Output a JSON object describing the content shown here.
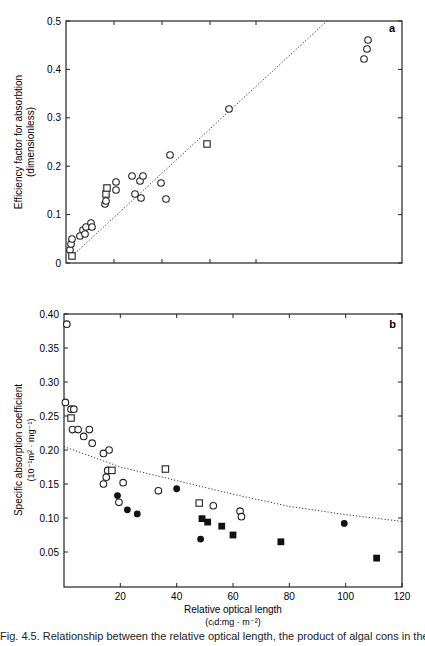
{
  "chart_data": [
    {
      "panel": "a",
      "type": "scatter",
      "title": "",
      "xlabel": "",
      "ylabel": "Efficiency factor for absorbtion (dimensionless)",
      "ylim": [
        0,
        0.5
      ],
      "yticks": [
        "0",
        "0.1",
        "0.2",
        "0.3",
        "0.4",
        "0.5"
      ],
      "x_tick_positions_px": [
        114,
        162,
        210,
        256
      ],
      "grid": false,
      "series": [
        {
          "name": "open circles",
          "marker": "open-circle",
          "points_px": [
            [
              70,
              250
            ],
            [
              71,
              244
            ],
            [
              72,
              239
            ],
            [
              80,
              236
            ],
            [
              83,
              230
            ],
            [
              85,
              234
            ],
            [
              86,
              227
            ],
            [
              91,
              223
            ],
            [
              92,
              227
            ],
            [
              105,
              204
            ],
            [
              106,
              201
            ],
            [
              116,
              190
            ],
            [
              116,
              182
            ],
            [
              132,
              176
            ],
            [
              135,
              194
            ],
            [
              140,
              181
            ],
            [
              141,
              198
            ],
            [
              143,
              176
            ],
            [
              161,
              183
            ],
            [
              166,
              199
            ],
            [
              170,
              155
            ],
            [
              229,
              109
            ],
            [
              364,
              59
            ],
            [
              367,
              49
            ],
            [
              368,
              40
            ]
          ]
        },
        {
          "name": "open squares",
          "marker": "open-square",
          "points_px": [
            [
              72,
              256
            ],
            [
              106,
              194
            ],
            [
              107,
              188
            ],
            [
              207,
              144
            ]
          ]
        }
      ],
      "trend": {
        "style": "dotted",
        "from_px": [
          70,
          258
        ],
        "to_px": [
          328,
          20
        ]
      }
    },
    {
      "panel": "b",
      "type": "scatter",
      "title": "",
      "xlabel": "Relative optical length (c_i d: mg · m^-2)",
      "ylabel": "Specific absorption coefficient (10^-1 m^2 · mg^-1)",
      "xlim": [
        0,
        120
      ],
      "ylim": [
        0,
        0.4
      ],
      "xticks": [
        "20",
        "40",
        "60",
        "80",
        "100",
        "120"
      ],
      "yticks": [
        "0.05",
        "0.10",
        "0.15",
        "0.20",
        "0.25",
        "0.30",
        "0.35",
        "0.40"
      ],
      "grid": false,
      "series": [
        {
          "name": "open circles",
          "marker": "open-circle",
          "values": [
            [
              1,
              0.385
            ],
            [
              0.5,
              0.27
            ],
            [
              2.5,
              0.26
            ],
            [
              3.5,
              0.26
            ],
            [
              3,
              0.23
            ],
            [
              5,
              0.23
            ],
            [
              7,
              0.22
            ],
            [
              9,
              0.23
            ],
            [
              10,
              0.21
            ],
            [
              16,
              0.2
            ],
            [
              14,
              0.195
            ],
            [
              15,
              0.16
            ],
            [
              15.5,
              0.17
            ],
            [
              14,
              0.15
            ],
            [
              21,
              0.152
            ],
            [
              19.5,
              0.123
            ],
            [
              33.5,
              0.14
            ],
            [
              53,
              0.118
            ],
            [
              62.5,
              0.11
            ],
            [
              63,
              0.102
            ]
          ]
        },
        {
          "name": "open squares",
          "marker": "open-square",
          "values": [
            [
              2.5,
              0.247
            ],
            [
              17,
              0.17
            ],
            [
              36,
              0.172
            ],
            [
              48,
              0.122
            ]
          ]
        },
        {
          "name": "filled circles",
          "marker": "filled-circle",
          "values": [
            [
              19,
              0.133
            ],
            [
              22.5,
              0.112
            ],
            [
              26,
              0.106
            ],
            [
              40,
              0.143
            ],
            [
              48.5,
              0.069
            ],
            [
              99.5,
              0.092
            ]
          ]
        },
        {
          "name": "filled squares",
          "marker": "filled-square",
          "values": [
            [
              49,
              0.099
            ],
            [
              51,
              0.094
            ],
            [
              56,
              0.088
            ],
            [
              60,
              0.075
            ],
            [
              77,
              0.065
            ],
            [
              111,
              0.041
            ]
          ]
        }
      ],
      "trend": {
        "style": "dotted",
        "points": [
          [
            0,
            0.205
          ],
          [
            20,
            0.175
          ],
          [
            40,
            0.155
          ],
          [
            60,
            0.135
          ],
          [
            80,
            0.117
          ],
          [
            100,
            0.105
          ],
          [
            120,
            0.095
          ]
        ]
      }
    }
  ],
  "panels": {
    "a": {
      "label": "a",
      "ylabel_line1": "Efficiency factor for absorbtion",
      "ylabel_line2": "(dimensionless)",
      "yticks": [
        "0.5",
        "0.4",
        "0.3",
        "0.2",
        "0.1",
        "0"
      ]
    },
    "b": {
      "label": "b",
      "ylabel_line1": "Specific absorption coefficient",
      "ylabel_line2": "(10⁻¹m² · mg⁻¹)",
      "yticks": [
        "0.40",
        "0.35",
        "0.30",
        "0.25",
        "0.20",
        "0.15",
        "0.10",
        "0.05"
      ],
      "xticks": [
        "20",
        "40",
        "60",
        "80",
        "100",
        "120"
      ],
      "xlabel_line1": "Relative optical length",
      "xlabel_line2": "(cᵢd:mg · m⁻²)"
    }
  },
  "caption": "Fig. 4.5. Relationship between the relative optical length, the product of algal cons in the"
}
